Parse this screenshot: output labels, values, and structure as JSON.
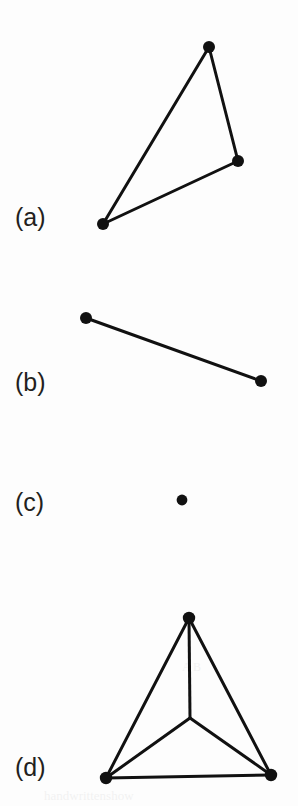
{
  "figure": {
    "width": 298,
    "height": 806,
    "background_color": "#fdfdfd",
    "ink_color": "#111111",
    "label_color": "#231f20",
    "node_radius": 5.2,
    "edge_width": 3.0
  },
  "panels": [
    {
      "id": "a",
      "label": "(a)",
      "label_x": 15,
      "label_y": 205,
      "graph_type": "triangle",
      "node_count": 3,
      "edge_count": 3,
      "nodes": [
        {
          "name": "a-top",
          "x": 209,
          "y": 47,
          "r": 6.0
        },
        {
          "name": "a-right",
          "x": 238,
          "y": 161,
          "r": 6.0
        },
        {
          "name": "a-bottom",
          "x": 103,
          "y": 224,
          "r": 6.0
        }
      ],
      "edges": [
        {
          "name": "a-edge-top-right",
          "from": 0,
          "to": 1
        },
        {
          "name": "a-edge-right-bottom",
          "from": 1,
          "to": 2
        },
        {
          "name": "a-edge-bottom-top",
          "from": 2,
          "to": 0
        }
      ]
    },
    {
      "id": "b",
      "label": "(b)",
      "label_x": 15,
      "label_y": 370,
      "graph_type": "single-edge",
      "node_count": 2,
      "edge_count": 1,
      "nodes": [
        {
          "name": "b-left",
          "x": 86,
          "y": 318,
          "r": 6.0
        },
        {
          "name": "b-right",
          "x": 261,
          "y": 381,
          "r": 6.0
        }
      ],
      "edges": [
        {
          "name": "b-edge-left-right",
          "from": 0,
          "to": 1
        }
      ]
    },
    {
      "id": "c",
      "label": "(c)",
      "label_x": 15,
      "label_y": 490,
      "graph_type": "isolated-vertex",
      "node_count": 1,
      "edge_count": 0,
      "nodes": [
        {
          "name": "c-single",
          "x": 182,
          "y": 500,
          "r": 5.4
        }
      ],
      "edges": []
    },
    {
      "id": "d",
      "label": "(d)",
      "label_x": 15,
      "label_y": 755,
      "graph_type": "complete-graph-k4",
      "node_count": 4,
      "edge_count": 6,
      "nodes": [
        {
          "name": "d-top",
          "x": 189,
          "y": 618,
          "r": 6.2
        },
        {
          "name": "d-bottom-left",
          "x": 106,
          "y": 778,
          "r": 6.2
        },
        {
          "name": "d-bottom-right",
          "x": 271,
          "y": 775,
          "r": 6.2
        },
        {
          "name": "d-center",
          "x": 190,
          "y": 718,
          "r": 0.0
        }
      ],
      "edges": [
        {
          "name": "d-edge-top-bottomleft",
          "from": 0,
          "to": 1
        },
        {
          "name": "d-edge-top-bottomright",
          "from": 0,
          "to": 2
        },
        {
          "name": "d-edge-bottomleft-bottomright",
          "from": 1,
          "to": 2
        },
        {
          "name": "d-edge-top-center",
          "from": 0,
          "to": 3
        },
        {
          "name": "d-edge-bottomleft-center",
          "from": 1,
          "to": 3
        },
        {
          "name": "d-edge-bottomright-center",
          "from": 2,
          "to": 3
        }
      ]
    }
  ],
  "scan_artifacts": [
    {
      "name": "bleed-line-1",
      "text": "handwrittenshow",
      "x": 44,
      "y": 788,
      "size": 13
    },
    {
      "name": "bleed-line-2",
      "text": "A B",
      "x": 182,
      "y": 660,
      "size": 12
    }
  ]
}
